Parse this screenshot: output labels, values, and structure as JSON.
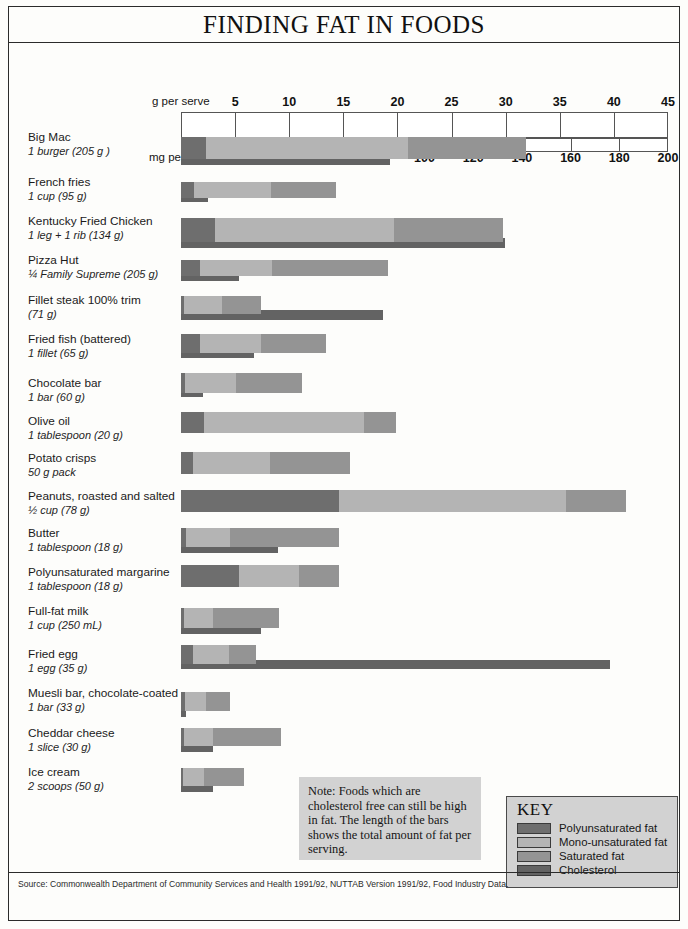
{
  "title": "FINDING FAT IN FOODS",
  "axis": {
    "g_caption": "g per serve",
    "mg_caption": "mg per serve",
    "g_ticks": [
      5,
      10,
      15,
      20,
      25,
      30,
      35,
      40,
      45
    ],
    "mg_ticks": [
      20,
      40,
      60,
      80,
      100,
      120,
      140,
      160,
      180,
      200
    ],
    "g_max": 45,
    "mg_max": 200
  },
  "note": {
    "text": "Note: Foods which are cholesterol free can still be high in fat. The length of the bars shows the total amount of fat per serving."
  },
  "key": {
    "title": "KEY",
    "items": [
      {
        "label": "Polyunsaturated fat",
        "color": "#6e6e6e"
      },
      {
        "label": "Mono-unsaturated fat",
        "color": "#b4b4b4"
      },
      {
        "label": "Saturated fat",
        "color": "#949494"
      },
      {
        "label": "Cholesterol",
        "color": "#636363"
      }
    ]
  },
  "source": "Source: Commonwealth Department of Community Services and Health 1991/92, NUTTAB Version 1991/92, Food Industry Data.",
  "chart_data": {
    "type": "bar",
    "title": "FINDING FAT IN FOODS",
    "xlabel": "g per serve",
    "xlabel2": "mg per serve",
    "xlim": [
      0,
      45
    ],
    "xlim2": [
      0,
      200
    ],
    "grid": true,
    "legend": [
      "Polyunsaturated fat",
      "Mono-unsaturated fat",
      "Saturated fat",
      "Cholesterol"
    ],
    "series_colors": {
      "poly": "#6e6e6e",
      "mono": "#b4b4b4",
      "sat": "#949494",
      "chol": "#636363"
    },
    "units": {
      "fat": "g per serve",
      "cholesterol": "mg per serve"
    },
    "categories": [
      {
        "name": "Big Mac",
        "serve": "1 burger (205 g )",
        "poly": 2.3,
        "mono": 18.7,
        "sat": 10.9,
        "total_fat": 31.9,
        "cholesterol": 86
      },
      {
        "name": "French fries",
        "serve": "1 cup (95 g)",
        "poly": 1.2,
        "mono": 7.1,
        "sat": 6.0,
        "total_fat": 14.3,
        "cholesterol": 11
      },
      {
        "name": "Kentucky Fried Chicken",
        "serve": "1 leg + 1 rib (134 g)",
        "poly": 3.1,
        "mono": 16.6,
        "sat": 10.1,
        "total_fat": 29.8,
        "cholesterol": 133
      },
      {
        "name": "Pizza Hut",
        "serve": "¼ Family Supreme (205 g)",
        "poly": 1.8,
        "mono": 6.6,
        "sat": 10.7,
        "total_fat": 19.1,
        "cholesterol": 24
      },
      {
        "name": "Fillet steak 100% trim",
        "serve": "(71 g)",
        "poly": 0.3,
        "mono": 3.5,
        "sat": 3.6,
        "total_fat": 7.4,
        "cholesterol": 83
      },
      {
        "name": "Fried fish (battered)",
        "serve": "1 fillet (65 g)",
        "poly": 1.8,
        "mono": 5.6,
        "sat": 6.0,
        "total_fat": 13.4,
        "cholesterol": 30
      },
      {
        "name": "Chocolate bar",
        "serve": "1 bar (60 g)",
        "poly": 0.4,
        "mono": 4.7,
        "sat": 6.1,
        "total_fat": 11.2,
        "cholesterol": 9
      },
      {
        "name": "Olive oil",
        "serve": "1 tablespoon (20 g)",
        "poly": 2.1,
        "mono": 14.8,
        "sat": 3.0,
        "total_fat": 19.9,
        "cholesterol": 0
      },
      {
        "name": "Potato crisps",
        "serve": "50 g pack",
        "poly": 1.1,
        "mono": 7.1,
        "sat": 7.4,
        "total_fat": 15.6,
        "cholesterol": 0
      },
      {
        "name": "Peanuts, roasted and salted",
        "serve": "½ cup (78 g)",
        "poly": 14.6,
        "mono": 21.0,
        "sat": 5.5,
        "total_fat": 41.1,
        "cholesterol": 0
      },
      {
        "name": "Butter",
        "serve": "1 tablespoon (18 g)",
        "poly": 0.5,
        "mono": 4.0,
        "sat": 10.1,
        "total_fat": 14.6,
        "cholesterol": 40
      },
      {
        "name": "Polyunsaturated margarine",
        "serve": "1 tablespoon (18 g)",
        "poly": 5.4,
        "mono": 5.5,
        "sat": 3.7,
        "total_fat": 14.6,
        "cholesterol": 0
      },
      {
        "name": "Full-fat milk",
        "serve": "1 cup (250 mL)",
        "poly": 0.3,
        "mono": 2.7,
        "sat": 6.1,
        "total_fat": 9.1,
        "cholesterol": 33
      },
      {
        "name": "Fried egg",
        "serve": "1 egg (35 g)",
        "poly": 1.1,
        "mono": 3.3,
        "sat": 2.5,
        "total_fat": 6.9,
        "cholesterol": 176
      },
      {
        "name": "Muesli bar, chocolate-coated",
        "serve": "1 bar (33 g)",
        "poly": 0.4,
        "mono": 1.9,
        "sat": 2.2,
        "total_fat": 4.5,
        "cholesterol": 2
      },
      {
        "name": "Cheddar cheese",
        "serve": "1 slice (30 g)",
        "poly": 0.3,
        "mono": 2.7,
        "sat": 6.2,
        "total_fat": 9.2,
        "cholesterol": 13
      },
      {
        "name": "Ice cream",
        "serve": "2 scoops (50 g)",
        "poly": 0.2,
        "mono": 1.9,
        "sat": 3.7,
        "total_fat": 5.8,
        "cholesterol": 13
      }
    ]
  }
}
